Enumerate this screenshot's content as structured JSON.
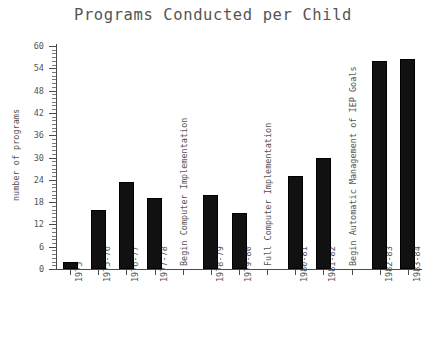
{
  "chart_data": {
    "type": "bar",
    "title": "Programs Conducted per Child",
    "xlabel": "",
    "ylabel": "number of programs",
    "ylim": [
      0,
      60
    ],
    "ytick_step": 6,
    "yticks": [
      0,
      6,
      12,
      18,
      24,
      30,
      36,
      42,
      48,
      54,
      60
    ],
    "grid": false,
    "legend": null,
    "bar_color": "#111111",
    "categories": [
      "1975",
      "1975-76",
      "1976-77",
      "1977-78",
      "",
      "1978-79",
      "1979-80",
      "",
      "1980-81",
      "1981-82",
      "",
      "1982-83",
      "1983-84"
    ],
    "values": [
      2,
      16,
      23.5,
      19,
      null,
      20,
      15,
      null,
      25,
      30,
      null,
      56,
      56.5
    ],
    "annotations": [
      "Begin Computer Implementation",
      "Full Computer Implementation",
      "Begin Automatic Management of IEP Goals"
    ]
  },
  "axis": {
    "y_title": "number of programs",
    "y_tick_labels": [
      "0",
      "6",
      "12",
      "18",
      "24",
      "30",
      "36",
      "42",
      "48",
      "54",
      "60"
    ],
    "x_tick_labels": [
      "1975",
      "1975-76",
      "1976-77",
      "1977-78",
      "1978-79",
      "1979-80",
      "1980-81",
      "1981-82",
      "1982-83",
      "1983-84"
    ]
  },
  "annotations": {
    "a1": "Begin Computer Implementation",
    "a2": "Full Computer Implementation",
    "a3": "Begin Automatic Management of IEP Goals"
  },
  "title": "Programs Conducted per Child"
}
